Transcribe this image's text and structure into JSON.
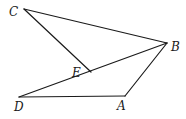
{
  "diagram": {
    "type": "geometry",
    "points": {
      "C": {
        "x": 24,
        "y": 9,
        "label": "C",
        "lx": 9,
        "ly": 16
      },
      "B": {
        "x": 167,
        "y": 43,
        "label": "B",
        "lx": 171,
        "ly": 51
      },
      "E": {
        "x": 91,
        "y": 72,
        "label": "E",
        "lx": 72,
        "ly": 77
      },
      "D": {
        "x": 19,
        "y": 97,
        "label": "D",
        "lx": 14,
        "ly": 111
      },
      "A": {
        "x": 125,
        "y": 96,
        "label": "A",
        "lx": 117,
        "ly": 110
      }
    },
    "segments": [
      {
        "from": "C",
        "to": "B"
      },
      {
        "from": "C",
        "to": "E"
      },
      {
        "from": "D",
        "to": "B"
      },
      {
        "from": "D",
        "to": "A"
      },
      {
        "from": "A",
        "to": "B"
      }
    ]
  }
}
